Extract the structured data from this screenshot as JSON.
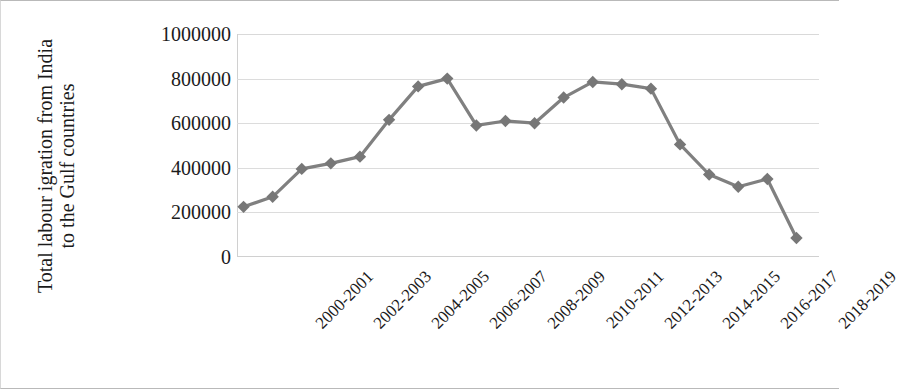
{
  "chart_data": {
    "type": "line",
    "title": "",
    "xlabel": "",
    "ylabel": "Total labour igration from India to the Gulf countries",
    "ylim": [
      0,
      1000000
    ],
    "ytick_labels": [
      "1000000",
      "800000",
      "600000",
      "400000",
      "200000",
      "0"
    ],
    "ytick_values": [
      1000000,
      800000,
      600000,
      400000,
      200000,
      0
    ],
    "grid": true,
    "legend": "none",
    "line_color": "#808080",
    "marker": "diamond",
    "marker_color": "#777777",
    "categories": [
      "2000-2001",
      "2001-2002",
      "2002-2003",
      "2003-2004",
      "2004-2005",
      "2005-2006",
      "2006-2007",
      "2007-2008",
      "2008-2009",
      "2009-2010",
      "2010-2011",
      "2011-2012",
      "2012-2013",
      "2013-2014",
      "2014-2015",
      "2015-2016",
      "2016-2017",
      "2017-2018",
      "2018-2019",
      "2019-2020"
    ],
    "xtick_labels": [
      "2000-2001",
      "2002-2003",
      "2004-2005",
      "2006-2007",
      "2008-2009",
      "2010-2011",
      "2012-2013",
      "2014-2015",
      "2016-2017",
      "2018-2019"
    ],
    "values": [
      225000,
      270000,
      395000,
      420000,
      450000,
      615000,
      765000,
      800000,
      590000,
      610000,
      600000,
      715000,
      785000,
      775000,
      755000,
      505000,
      370000,
      315000,
      350000,
      85000
    ],
    "series": [
      {
        "name": "Total labour migration from India to the Gulf countries",
        "values": [
          225000,
          270000,
          395000,
          420000,
          450000,
          615000,
          765000,
          800000,
          590000,
          610000,
          600000,
          715000,
          785000,
          775000,
          755000,
          505000,
          370000,
          315000,
          350000,
          85000
        ]
      }
    ]
  }
}
